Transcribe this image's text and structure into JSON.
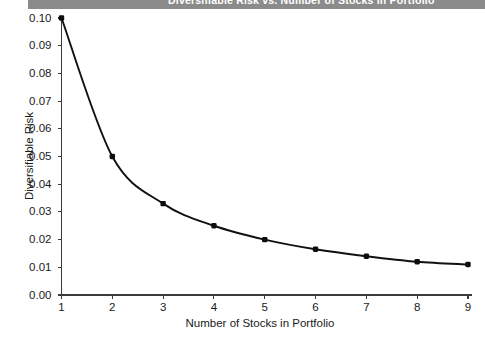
{
  "banner": {
    "title": "Diversifiable Risk vs. Number of Stocks in Portfolio",
    "color": "#8b8b8b"
  },
  "chart_data": {
    "type": "line",
    "title": "Diversifiable Risk vs. Number of Stocks in Portfolio",
    "xlabel": "Number of Stocks in Portfolio",
    "ylabel": "Diversifiable Risk",
    "x": [
      1,
      2,
      3,
      4,
      5,
      6,
      7,
      8,
      9
    ],
    "values": [
      0.1,
      0.05,
      0.033,
      0.025,
      0.02,
      0.0165,
      0.014,
      0.012,
      0.011
    ],
    "xtick_labels": [
      "1",
      "2",
      "3",
      "4",
      "5",
      "6",
      "7",
      "8",
      "9"
    ],
    "ytick_labels": [
      "0.00",
      "0.01",
      "0.02",
      "0.03",
      "0.04",
      "0.05",
      "0.06",
      "0.07",
      "0.08",
      "0.09",
      "0.10"
    ],
    "ytick_values": [
      0.0,
      0.01,
      0.02,
      0.03,
      0.04,
      0.05,
      0.06,
      0.07,
      0.08,
      0.09,
      0.1
    ],
    "xlim": [
      1,
      9
    ],
    "ylim": [
      0.0,
      0.1
    ],
    "grid": false,
    "legend": null,
    "marker": "filled-square",
    "line_color": "#111111",
    "marker_color": "#0d0d0d"
  }
}
